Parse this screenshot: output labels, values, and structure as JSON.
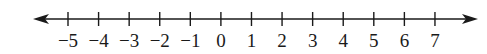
{
  "chart_data": {
    "type": "number_line",
    "min": -5,
    "max": 7,
    "step": 1,
    "ticks": [
      -5,
      -4,
      -3,
      -2,
      -1,
      0,
      1,
      2,
      3,
      4,
      5,
      6,
      7
    ],
    "tick_labels": [
      "−5",
      "−4",
      "−3",
      "−2",
      "−1",
      "0",
      "1",
      "2",
      "3",
      "4",
      "5",
      "6",
      "7"
    ],
    "arrows": {
      "left": true,
      "right": true
    },
    "points": [],
    "title": "",
    "xlabel": ""
  },
  "layout": {
    "axis_y": 19,
    "line_start_x": 33,
    "line_end_x": 478,
    "first_tick_x": 68,
    "tick_spacing": 30.58,
    "tick_half_height": 7
  },
  "colors": {
    "line": "#1a1a1a",
    "text": "#1a1a1a",
    "background": "#ffffff"
  }
}
